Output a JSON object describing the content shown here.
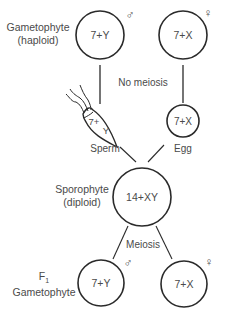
{
  "diagram": {
    "colors": {
      "ink": "#2a2a2a",
      "text": "#4a4a4a",
      "background": "#ffffff"
    },
    "labels": {
      "gametophyte_top": [
        "Gametophyte",
        "(haploid)"
      ],
      "no_meiosis": "No meiosis",
      "sperm": "Sperm",
      "egg": "Egg",
      "sporophyte": [
        "Sporophyte",
        "(diploid)"
      ],
      "meiosis": "Meiosis",
      "f1_gametophyte": {
        "prefix": "F",
        "subscript": "1",
        "line2": "Gametophyte"
      }
    },
    "nodes": {
      "top_male": {
        "text": "7+Y",
        "sex_symbol": "♂"
      },
      "top_female": {
        "text": "7+X",
        "sex_symbol": "♀"
      },
      "sperm": {
        "text_a": "7+",
        "text_b": "Y"
      },
      "egg": {
        "text": "7+X"
      },
      "sporophyte": {
        "text": "14+XY"
      },
      "f1_male": {
        "text": "7+Y",
        "sex_symbol": "♂"
      },
      "f1_female": {
        "text": "7+X",
        "sex_symbol": "♀"
      }
    }
  }
}
